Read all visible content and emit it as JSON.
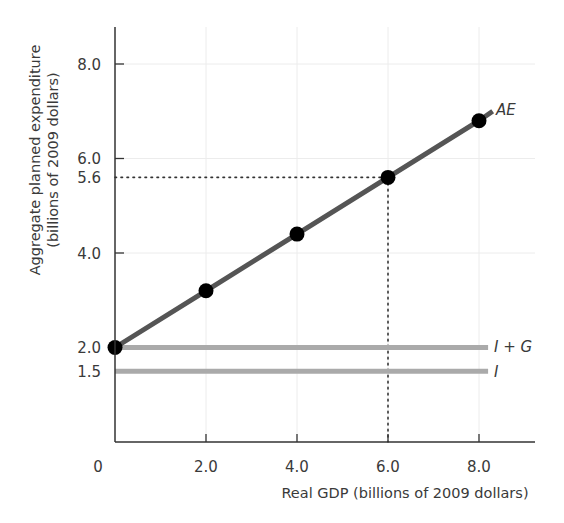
{
  "chart_data": {
    "type": "line",
    "title": "",
    "xlabel": "Real GDP (billions of 2009 dollars)",
    "ylabel_line1": "Aggregate planned expenditure",
    "ylabel_line2": "(billions of 2009 dollars)",
    "xlim": [
      0,
      9.3
    ],
    "ylim": [
      0,
      8.8
    ],
    "x_ticks": [
      2.0,
      4.0,
      6.0,
      8.0
    ],
    "x_tick_labels": [
      "2.0",
      "4.0",
      "6.0",
      "8.0"
    ],
    "x_origin_label": "0",
    "y_ticks": [
      1.5,
      2.0,
      4.0,
      5.6,
      6.0,
      8.0
    ],
    "y_tick_labels": [
      "1.5",
      "2.0",
      "4.0",
      "5.6",
      "6.0",
      "8.0"
    ],
    "grid": true,
    "series": [
      {
        "name": "AE",
        "kind": "line-with-markers",
        "x": [
          0,
          2,
          4,
          6,
          8
        ],
        "y": [
          2.0,
          3.2,
          4.4,
          5.6,
          6.8
        ],
        "line_end": [
          8.3,
          7.0
        ],
        "color": "#555555",
        "marker_color": "#000000"
      },
      {
        "name": "I + G",
        "kind": "horizontal",
        "y": 2.0,
        "x_range": [
          0,
          8.2
        ],
        "color": "#aaaaaa"
      },
      {
        "name": "I",
        "kind": "horizontal",
        "y": 1.5,
        "x_range": [
          0,
          8.2
        ],
        "color": "#aaaaaa"
      }
    ],
    "annotations": [
      {
        "type": "dotted-guide",
        "x": 6.0,
        "y": 5.6,
        "description": "Equilibrium: Real GDP 6.0, AE 5.6"
      }
    ]
  },
  "labels": {
    "ae": "AE",
    "i_plus_g": "I + G",
    "i": "I"
  }
}
